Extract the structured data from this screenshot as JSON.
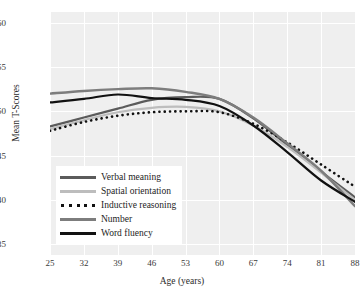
{
  "chart_data": {
    "type": "line",
    "title": "",
    "xlabel": "Age (years)",
    "ylabel": "Mean T-Scores",
    "x": [
      25,
      32,
      39,
      46,
      53,
      60,
      67,
      74,
      81,
      88
    ],
    "xticklabels": [
      "25",
      "32",
      "39",
      "46",
      "53",
      "60",
      "67",
      "74",
      "81",
      "88"
    ],
    "yticklabels": [
      "60",
      "55",
      "50",
      "45",
      "40",
      "35"
    ],
    "yticks": [
      60,
      55,
      50,
      45,
      40,
      35
    ],
    "xlim": [
      25,
      88
    ],
    "ylim": [
      33.8,
      61.2
    ],
    "grid": true,
    "legend_position": "lower-left-inside",
    "plot_background": "#efefef",
    "gridline_color": "#ffffff",
    "series": [
      {
        "name": "Verbal meaning",
        "color": "#5b5b5b",
        "style": "solid",
        "width": 2.2,
        "values": [
          48.3,
          49.3,
          50.3,
          51.3,
          51.6,
          51.4,
          49.2,
          46.2,
          43.2,
          40.3
        ]
      },
      {
        "name": "Spatial orientation",
        "color": "#bdbdbd",
        "style": "solid",
        "width": 2.2,
        "values": [
          48.0,
          49.0,
          49.9,
          50.4,
          50.5,
          50.0,
          48.4,
          46.0,
          43.1,
          40.0
        ]
      },
      {
        "name": "Inductive reasoning",
        "color": "#111111",
        "style": "dotted",
        "width": 2.6,
        "values": [
          47.8,
          48.8,
          49.5,
          49.9,
          50.0,
          49.9,
          48.6,
          46.5,
          44.0,
          41.5
        ]
      },
      {
        "name": "Number",
        "color": "#7d7d7d",
        "style": "solid",
        "width": 2.4,
        "values": [
          52.0,
          52.3,
          52.5,
          52.6,
          52.2,
          51.4,
          49.3,
          46.4,
          43.3,
          39.3
        ]
      },
      {
        "name": "Word fluency",
        "color": "#111111",
        "style": "solid",
        "width": 2.2,
        "values": [
          51.0,
          51.4,
          51.9,
          51.5,
          51.3,
          50.6,
          48.4,
          45.4,
          42.2,
          39.8
        ]
      }
    ]
  },
  "legend": {
    "items": [
      {
        "label": "Verbal meaning"
      },
      {
        "label": "Spatial orientation"
      },
      {
        "label": "Inductive reasoning"
      },
      {
        "label": "Number"
      },
      {
        "label": "Word fluency"
      }
    ]
  }
}
